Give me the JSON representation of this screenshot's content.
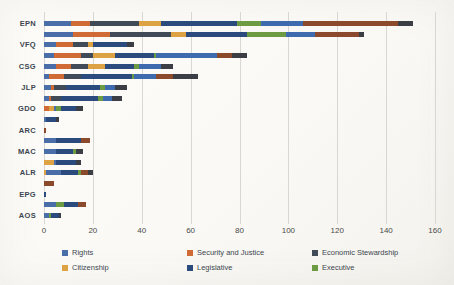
{
  "chart_data": {
    "type": "bar",
    "orientation": "horizontal",
    "stacked": true,
    "grouped_bars_per_category": 2,
    "title": "",
    "xlabel": "",
    "ylabel": "",
    "xlim": [
      0,
      160
    ],
    "x_ticks": [
      0,
      20,
      40,
      60,
      80,
      100,
      120,
      140,
      160
    ],
    "grid": "vertical-on",
    "legend_position": "bottom",
    "palette": {
      "rights": "#4A6EA8",
      "security": "#D06B35",
      "economic": "#414B57",
      "citizenship": "#DDA243",
      "legislative": "#2B4B7E",
      "executive": "#6D9B44",
      "blue2": "#3E6BAD",
      "brown": "#8A4A2B",
      "gray2": "#3B3F45"
    },
    "legend": [
      {
        "label": "Rights",
        "key": "rights"
      },
      {
        "label": "Security and Justice",
        "key": "security"
      },
      {
        "label": "Economic Stewardship",
        "key": "economic"
      },
      {
        "label": "Citizenship",
        "key": "citizenship"
      },
      {
        "label": "Legislative",
        "key": "legislative"
      },
      {
        "label": "Executive",
        "key": "executive"
      }
    ],
    "categories": [
      "EPN",
      "VFQ",
      "CSG",
      "JLP",
      "GDO",
      "ARC",
      "MAC",
      "ALR",
      "EPG",
      "AOS"
    ],
    "bars": [
      {
        "label": "EPN",
        "rows": [
          [
            {
              "s": "rights",
              "v": 11
            },
            {
              "s": "security",
              "v": 8
            },
            {
              "s": "economic",
              "v": 20
            },
            {
              "s": "citizenship",
              "v": 9
            },
            {
              "s": "legislative",
              "v": 31
            },
            {
              "s": "executive",
              "v": 10
            },
            {
              "s": "blue2",
              "v": 17
            },
            {
              "s": "brown",
              "v": 39
            },
            {
              "s": "gray2",
              "v": 6
            }
          ],
          [
            {
              "s": "rights",
              "v": 12
            },
            {
              "s": "security",
              "v": 15
            },
            {
              "s": "economic",
              "v": 25
            },
            {
              "s": "citizenship",
              "v": 6
            },
            {
              "s": "legislative",
              "v": 25
            },
            {
              "s": "executive",
              "v": 16
            },
            {
              "s": "blue2",
              "v": 12
            },
            {
              "s": "brown",
              "v": 18
            },
            {
              "s": "gray2",
              "v": 2
            }
          ]
        ]
      },
      {
        "label": "VFQ",
        "rows": [
          [
            {
              "s": "rights",
              "v": 5
            },
            {
              "s": "security",
              "v": 7
            },
            {
              "s": "economic",
              "v": 6
            },
            {
              "s": "citizenship",
              "v": 2
            },
            {
              "s": "legislative",
              "v": 14
            },
            {
              "s": "gray2",
              "v": 3
            }
          ],
          [
            {
              "s": "rights",
              "v": 4
            },
            {
              "s": "security",
              "v": 11
            },
            {
              "s": "economic",
              "v": 5
            },
            {
              "s": "citizenship",
              "v": 9
            },
            {
              "s": "legislative",
              "v": 16
            },
            {
              "s": "executive",
              "v": 1
            },
            {
              "s": "blue2",
              "v": 25
            },
            {
              "s": "brown",
              "v": 6
            },
            {
              "s": "gray2",
              "v": 6
            }
          ]
        ]
      },
      {
        "label": "CSG",
        "rows": [
          [
            {
              "s": "rights",
              "v": 5
            },
            {
              "s": "security",
              "v": 6
            },
            {
              "s": "economic",
              "v": 7
            },
            {
              "s": "citizenship",
              "v": 7
            },
            {
              "s": "legislative",
              "v": 12
            },
            {
              "s": "executive",
              "v": 2
            },
            {
              "s": "blue2",
              "v": 9
            },
            {
              "s": "gray2",
              "v": 5
            }
          ],
          [
            {
              "s": "rights",
              "v": 2
            },
            {
              "s": "security",
              "v": 6
            },
            {
              "s": "economic",
              "v": 7
            },
            {
              "s": "legislative",
              "v": 21
            },
            {
              "s": "executive",
              "v": 1
            },
            {
              "s": "blue2",
              "v": 9
            },
            {
              "s": "brown",
              "v": 7
            },
            {
              "s": "gray2",
              "v": 10
            }
          ]
        ]
      },
      {
        "label": "JLP",
        "rows": [
          [
            {
              "s": "rights",
              "v": 3
            },
            {
              "s": "security",
              "v": 1
            },
            {
              "s": "economic",
              "v": 5
            },
            {
              "s": "legislative",
              "v": 14
            },
            {
              "s": "executive",
              "v": 2
            },
            {
              "s": "blue2",
              "v": 4
            },
            {
              "s": "gray2",
              "v": 5
            }
          ],
          [
            {
              "s": "rights",
              "v": 2
            },
            {
              "s": "security",
              "v": 1
            },
            {
              "s": "economic",
              "v": 4
            },
            {
              "s": "legislative",
              "v": 15
            },
            {
              "s": "executive",
              "v": 2
            },
            {
              "s": "blue2",
              "v": 4
            },
            {
              "s": "gray2",
              "v": 4
            }
          ]
        ]
      },
      {
        "label": "GDO",
        "rows": [
          [
            {
              "s": "security",
              "v": 2
            },
            {
              "s": "citizenship",
              "v": 2
            },
            {
              "s": "rights",
              "v": 1
            },
            {
              "s": "executive",
              "v": 2
            },
            {
              "s": "legislative",
              "v": 6
            },
            {
              "s": "gray2",
              "v": 3
            }
          ],
          [
            {
              "s": "rights",
              "v": 1
            },
            {
              "s": "legislative",
              "v": 4
            },
            {
              "s": "gray2",
              "v": 1
            }
          ]
        ]
      },
      {
        "label": "ARC",
        "rows": [
          [
            {
              "s": "brown",
              "v": 1
            }
          ],
          [
            {
              "s": "rights",
              "v": 5
            },
            {
              "s": "legislative",
              "v": 10
            },
            {
              "s": "brown",
              "v": 4
            }
          ]
        ]
      },
      {
        "label": "MAC",
        "rows": [
          [
            {
              "s": "rights",
              "v": 5
            },
            {
              "s": "legislative",
              "v": 7
            },
            {
              "s": "executive",
              "v": 1
            },
            {
              "s": "gray2",
              "v": 3
            }
          ],
          [
            {
              "s": "citizenship",
              "v": 4
            },
            {
              "s": "rights",
              "v": 1
            },
            {
              "s": "legislative",
              "v": 8
            },
            {
              "s": "gray2",
              "v": 2
            }
          ]
        ]
      },
      {
        "label": "ALR",
        "rows": [
          [
            {
              "s": "citizenship",
              "v": 1
            },
            {
              "s": "rights",
              "v": 6
            },
            {
              "s": "legislative",
              "v": 7
            },
            {
              "s": "executive",
              "v": 1
            },
            {
              "s": "brown",
              "v": 3
            },
            {
              "s": "gray2",
              "v": 2
            }
          ],
          [
            {
              "s": "brown",
              "v": 4
            }
          ]
        ]
      },
      {
        "label": "EPG",
        "rows": [
          [
            {
              "s": "legislative",
              "v": 1
            }
          ],
          [
            {
              "s": "rights",
              "v": 5
            },
            {
              "s": "executive",
              "v": 3
            },
            {
              "s": "legislative",
              "v": 6
            },
            {
              "s": "brown",
              "v": 3
            }
          ]
        ]
      },
      {
        "label": "AOS",
        "rows": [
          [
            {
              "s": "rights",
              "v": 2
            },
            {
              "s": "executive",
              "v": 1
            },
            {
              "s": "legislative",
              "v": 3
            },
            {
              "s": "gray2",
              "v": 1
            }
          ],
          []
        ]
      }
    ]
  }
}
